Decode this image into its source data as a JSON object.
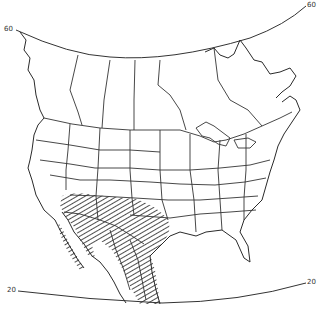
{
  "map": {
    "region": "North America",
    "projection": "conic",
    "latitude_labels": [
      {
        "label": "60",
        "side": "left"
      },
      {
        "label": "60",
        "side": "right"
      },
      {
        "label": "20",
        "side": "left"
      },
      {
        "label": "20",
        "side": "right"
      }
    ],
    "range": {
      "pattern": "diagonal hatching",
      "area": "Southwestern United States and Mexico",
      "color": "#333333"
    },
    "colors": {
      "background": "#ffffff",
      "lines": "#333333"
    }
  }
}
